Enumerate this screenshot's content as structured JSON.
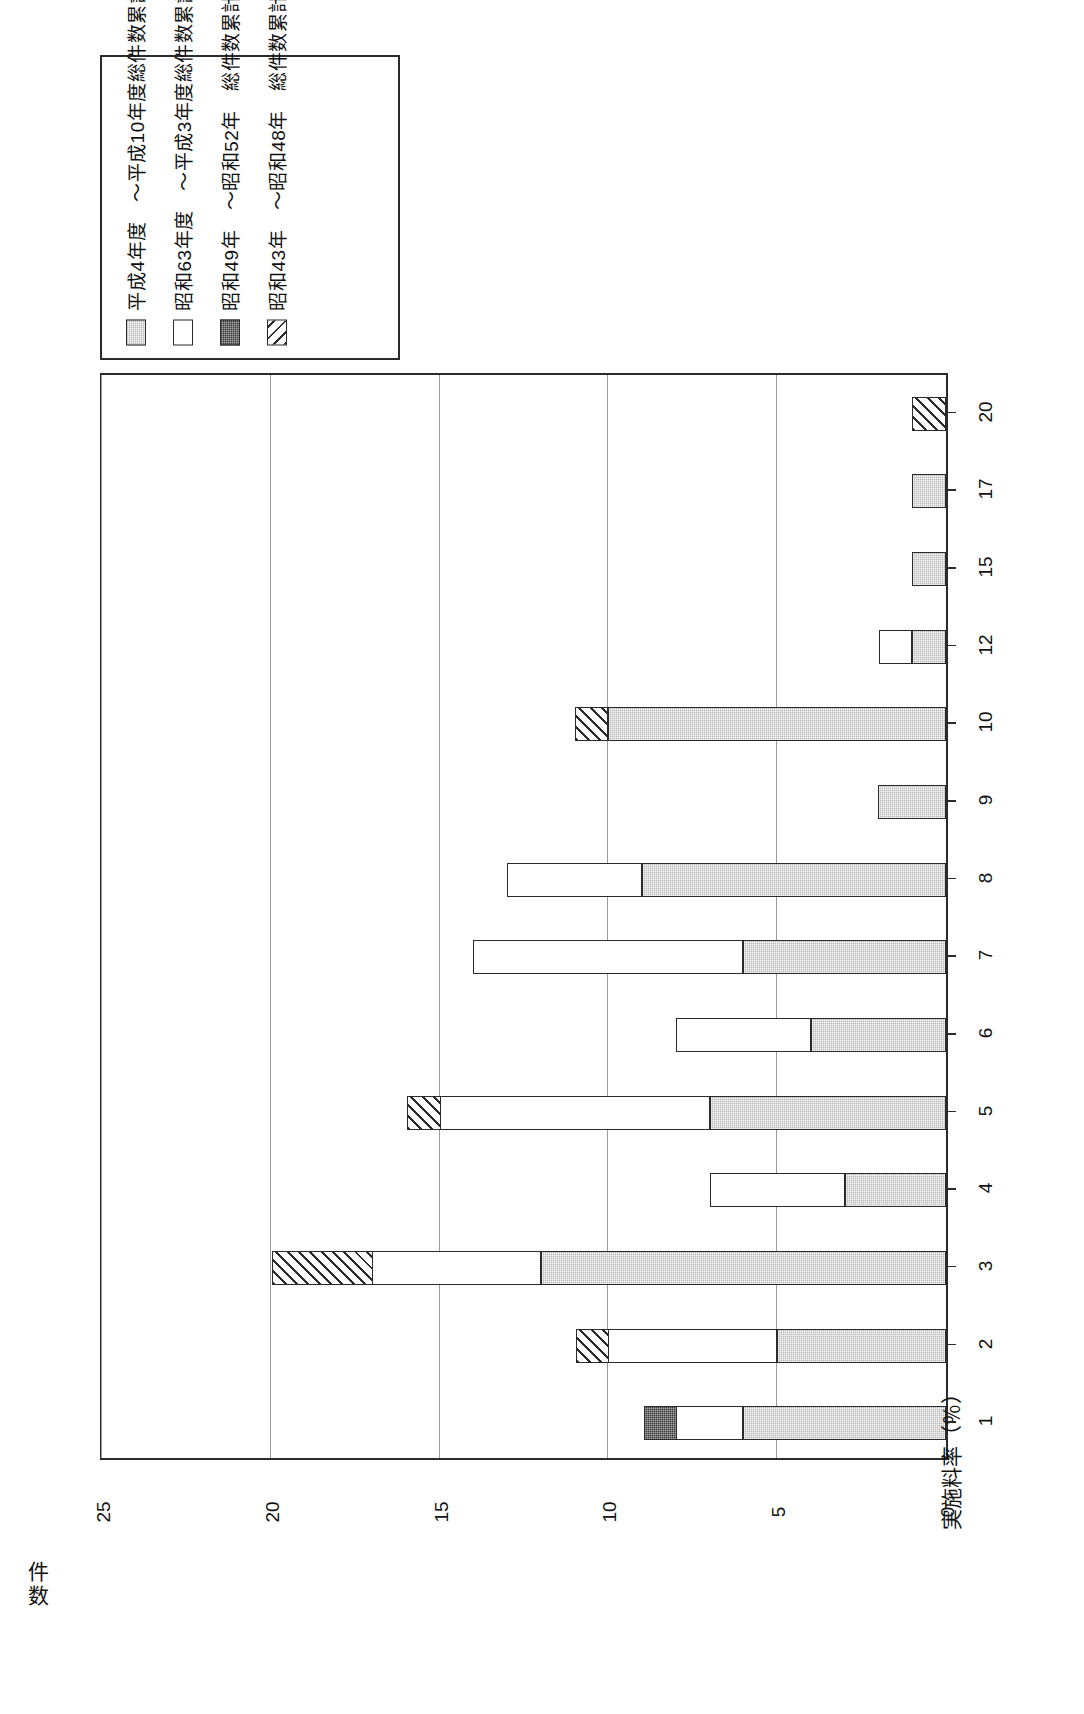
{
  "title": {
    "number": "図2－31－1",
    "caption": "他に分類されない製造業・産業の技術（イニシャル　有）の実施料率別契約件数"
  },
  "legend": {
    "items": [
      {
        "label": "平成4年度　～平成10年度総件数累計",
        "fill": "gray"
      },
      {
        "label": "昭和63年度　～平成3年度総件数累計",
        "fill": "white"
      },
      {
        "label": "昭和49年　～昭和52年　総件数累計",
        "fill": "dark"
      },
      {
        "label": "昭和43年　～昭和48年　総件数累計",
        "fill": "hatch"
      }
    ]
  },
  "chart_data": {
    "type": "bar",
    "orientation": "horizontal-rotated",
    "title": "他に分類されない製造業・産業の技術（イニシャル　有）の実施料率別契約件数",
    "xlabel": "実施料率（％）",
    "ylabel_l1": "件",
    "ylabel_l2": "数",
    "ylabel": "件数",
    "ylim": [
      0,
      25
    ],
    "yticks": [
      0,
      5,
      10,
      15,
      20,
      25
    ],
    "grid": true,
    "legend_position": "top-left",
    "categories": [
      "1",
      "2",
      "3",
      "4",
      "5",
      "6",
      "7",
      "8",
      "9",
      "10",
      "12",
      "15",
      "17",
      "20"
    ],
    "series": [
      {
        "name": "平成4年度　～平成10年度総件数累計",
        "fill": "gray",
        "values": [
          6,
          5,
          12,
          3,
          7,
          4,
          6,
          9,
          2,
          10,
          1,
          1,
          1,
          0
        ]
      },
      {
        "name": "昭和63年度　～平成3年度総件数累計",
        "fill": "white",
        "values": [
          2,
          5,
          5,
          4,
          8,
          4,
          8,
          4,
          0,
          0,
          1,
          0,
          0,
          0
        ]
      },
      {
        "name": "昭和49年　～昭和52年　総件数累計",
        "fill": "dark",
        "values": [
          1,
          0,
          0,
          0,
          0,
          0,
          0,
          0,
          0,
          0,
          0,
          0,
          0,
          0
        ]
      },
      {
        "name": "昭和43年　～昭和48年　総件数累計",
        "fill": "hatch",
        "values": [
          0,
          1,
          3,
          0,
          1,
          0,
          0,
          0,
          0,
          1,
          0,
          0,
          0,
          1
        ]
      }
    ],
    "totals": [
      9,
      11,
      20,
      7,
      16,
      8,
      14,
      13,
      2,
      11,
      2,
      1,
      1,
      1
    ]
  }
}
